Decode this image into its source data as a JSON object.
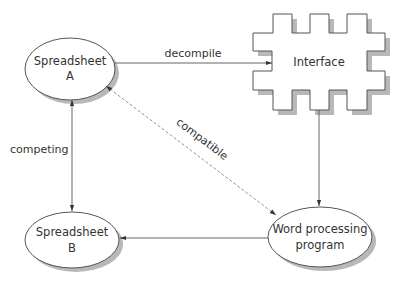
{
  "diagram": {
    "nodes": {
      "spreadsheet_a": {
        "line1": "Spreadsheet",
        "line2": "A",
        "shape": "ellipse"
      },
      "spreadsheet_b": {
        "line1": "Spreadsheet",
        "line2": "B",
        "shape": "ellipse"
      },
      "interface": {
        "label": "Interface",
        "shape": "puzzle-connector"
      },
      "word_processing": {
        "line1": "Word processing",
        "line2": "program",
        "shape": "ellipse"
      }
    },
    "edges": [
      {
        "from": "spreadsheet_a",
        "to": "interface",
        "label": "decompile",
        "style": "solid",
        "direction": "forward"
      },
      {
        "from": "interface",
        "to": "word_processing",
        "label": "",
        "style": "solid",
        "direction": "forward"
      },
      {
        "from": "word_processing",
        "to": "spreadsheet_b",
        "label": "",
        "style": "solid",
        "direction": "forward"
      },
      {
        "from": "spreadsheet_a",
        "to": "spreadsheet_b",
        "label": "competing",
        "style": "solid",
        "direction": "both"
      },
      {
        "from": "spreadsheet_a",
        "to": "word_processing",
        "label": "compatible",
        "style": "dashed",
        "direction": "both"
      }
    ],
    "colors": {
      "stroke": "#555555",
      "shadow": "#b8b8b8",
      "text": "#333333",
      "background": "#ffffff"
    }
  }
}
